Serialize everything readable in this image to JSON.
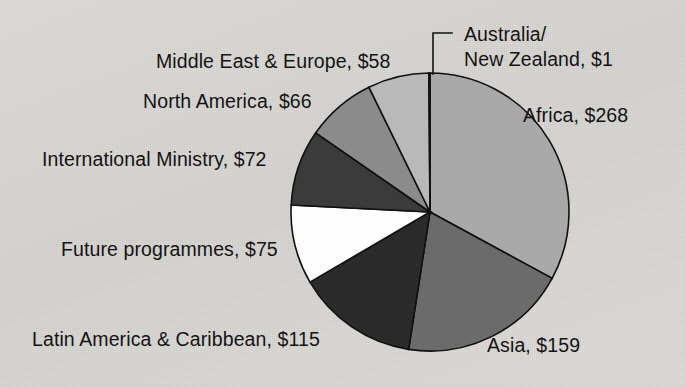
{
  "figure": {
    "background_color": "#d9d9d7",
    "text_color": "#131313"
  },
  "chart_data": {
    "type": "pie",
    "title": "",
    "subtitle": "",
    "xlabel": "",
    "ylabel": "",
    "units": "USD millions",
    "value_prefix": "$",
    "total": 814,
    "start_angle_deg": 0,
    "direction": "clockwise",
    "grid": false,
    "legend": "none",
    "labels_position": "outside-with-leader-lines",
    "categories": [
      "Africa",
      "Asia",
      "Latin America & Caribbean",
      "Future programmes",
      "International Ministry",
      "North America",
      "Middle East & Europe",
      "Australia/New Zealand"
    ],
    "values": [
      268,
      159,
      115,
      75,
      72,
      66,
      58,
      1
    ],
    "slices": [
      {
        "name": "Africa",
        "label": "Africa, $268",
        "value": 268,
        "color": "#a9a9a9",
        "start_deg": 0,
        "sweep_deg": 118.53,
        "label_x": 523,
        "label_y": 104,
        "leader": false
      },
      {
        "name": "Asia",
        "label": "Asia, $159",
        "value": 159,
        "color": "#6b6b6b",
        "start_deg": 118.53,
        "sweep_deg": 70.32,
        "label_x": 487,
        "label_y": 334,
        "leader": false
      },
      {
        "name": "Latin America & Caribbean",
        "label": "Latin America & Caribbean, $115",
        "value": 115,
        "color": "#2b2b2b",
        "start_deg": 188.85,
        "sweep_deg": 50.86,
        "label_x": 32,
        "label_y": 328,
        "leader": false
      },
      {
        "name": "Future programmes",
        "label": "Future programmes, $75",
        "value": 75,
        "color": "#fdfdfd",
        "start_deg": 239.71,
        "sweep_deg": 33.17,
        "label_x": 61,
        "label_y": 238,
        "leader": false
      },
      {
        "name": "International Ministry",
        "label": "International Ministry, $72",
        "value": 72,
        "color": "#3b3b3b",
        "start_deg": 272.88,
        "sweep_deg": 31.84,
        "label_x": 42,
        "label_y": 148,
        "leader": false
      },
      {
        "name": "North America",
        "label": "North America, $66",
        "value": 66,
        "color": "#8b8b8b",
        "start_deg": 304.72,
        "sweep_deg": 29.19,
        "label_x": 143,
        "label_y": 90,
        "leader": false
      },
      {
        "name": "Middle East & Europe",
        "label": "Middle East & Europe, $58",
        "value": 58,
        "color": "#b9b9b9",
        "start_deg": 333.91,
        "sweep_deg": 25.65,
        "label_x": 156,
        "label_y": 50,
        "leader": false
      },
      {
        "name": "Australia/New Zealand",
        "label": "Australia/\nNew Zealand, $1",
        "label_line_1": "Australia/",
        "label_line_2": "New Zealand, $1",
        "value": 1,
        "color": "#cfcfcf",
        "start_deg": 359.56,
        "sweep_deg": 0.44,
        "label_x": 464,
        "label_y": 22,
        "leader": true
      }
    ],
    "geometry": {
      "center_x": 430,
      "center_y": 212,
      "radius": 139,
      "stroke_color": "#101010",
      "stroke_width": 1.6
    }
  },
  "leader_line": {
    "name": "australia-nz-leader-line",
    "points": "452,33 433,33 433,74",
    "color": "#131313",
    "width": 1.6
  }
}
